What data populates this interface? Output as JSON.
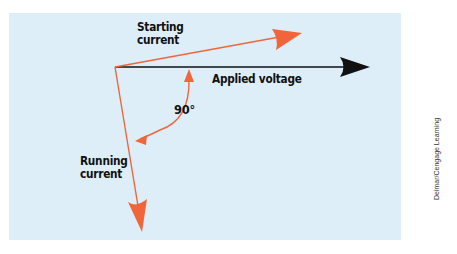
{
  "diagram": {
    "labels": {
      "starting_current": [
        "Starting",
        "current"
      ],
      "applied_voltage": "Applied voltage",
      "angle": "90°",
      "running_current": [
        "Running",
        "current"
      ]
    },
    "credit": "Delmar/Cengage Learning",
    "colors": {
      "background_panel": "#ddeef8",
      "current_arrow": "#f0653a",
      "voltage_arrow": "#111111",
      "text": "#111111"
    },
    "vectors": [
      {
        "name": "applied-voltage",
        "from": [
          115,
          67
        ],
        "to": [
          370,
          67
        ],
        "color": "#111111"
      },
      {
        "name": "starting-current",
        "from": [
          115,
          67
        ],
        "to": [
          302,
          33
        ],
        "color": "#f0653a"
      },
      {
        "name": "running-current",
        "from": [
          115,
          67
        ],
        "to": [
          142,
          232
        ],
        "color": "#f0653a"
      }
    ],
    "angle_arc": {
      "value_degrees": 90,
      "from_vector": "applied-voltage",
      "to_vector": "running-current"
    }
  }
}
